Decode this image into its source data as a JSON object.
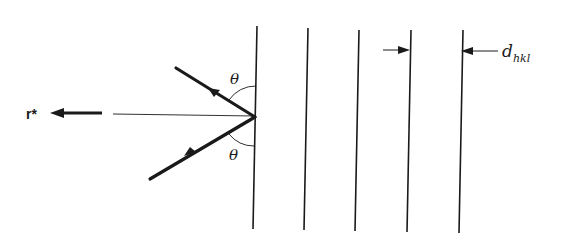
{
  "diagram": {
    "labels": {
      "reciprocal_vector": "r*",
      "angle_incident": "θ",
      "angle_reflected": "θ",
      "spacing": "d",
      "spacing_subscript": "hkl"
    },
    "planes": [
      {
        "x1": 257,
        "y1": 26,
        "x2": 253,
        "y2": 229
      },
      {
        "x1": 308,
        "y1": 28,
        "x2": 304,
        "y2": 230
      },
      {
        "x1": 359,
        "y1": 30,
        "x2": 355,
        "y2": 231
      },
      {
        "x1": 411,
        "y1": 30,
        "x2": 407,
        "y2": 232
      },
      {
        "x1": 463,
        "y1": 30,
        "x2": 459,
        "y2": 233
      }
    ],
    "colors": {
      "line": "#1a1a1a",
      "background": "#ffffff"
    }
  }
}
